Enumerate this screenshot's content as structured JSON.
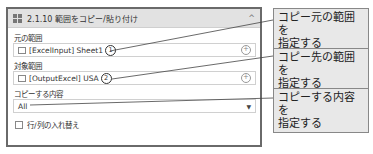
{
  "panel": {
    "title": "2.1.10 範囲をコピー/貼り付け",
    "collapse_glyph": "^",
    "source_range": {
      "label": "元の範囲",
      "value": "[ExcelInput] Sheet1",
      "marker": "1",
      "add_glyph": "+"
    },
    "target_range": {
      "label": "対象範囲",
      "value": "[OutputExcel] USA",
      "marker": "2",
      "add_glyph": "+"
    },
    "copy_content": {
      "label": "コピーする内容",
      "value": "All",
      "dropdown_glyph": "▼"
    },
    "transpose": {
      "label": "行/列の入れ替え",
      "checked": false
    }
  },
  "callouts": [
    {
      "line1": "コピー元の範囲を",
      "line2": "指定する"
    },
    {
      "line1": "コピー先の範囲を",
      "line2": "指定する"
    },
    {
      "line1": "コピーする内容を",
      "line2": "指定する"
    }
  ],
  "colors": {
    "panel_border": "#6a6a6a",
    "header_bg": "#e2e2e2",
    "callout_bg": "#e8e8e8"
  }
}
